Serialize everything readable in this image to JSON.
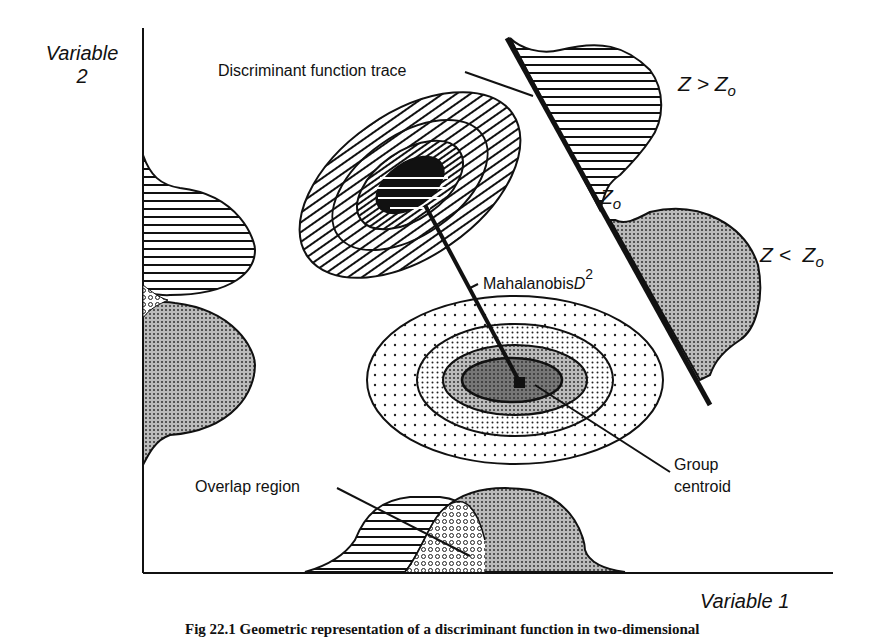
{
  "diagram": {
    "y_axis_label_line1": "Variable",
    "y_axis_label_line2": "2",
    "x_axis_label": "Variable 1",
    "labels": {
      "discriminant_trace": "Discriminant function trace",
      "z_greater": "Z > Z",
      "z_greater_sub": "o",
      "z_less": "Z <  Z",
      "z_less_sub": "o",
      "z_zero": "Z",
      "z_zero_sub": "o",
      "mahalanobis": "Mahalanobis",
      "mahalanobis_d": "D",
      "mahalanobis_sup": "2",
      "group_centroid_line1": "Group",
      "group_centroid_line2": "centroid",
      "overlap_region": "Overlap region"
    },
    "caption": "Fig 22.1 Geometric representation of a discriminant function in two-dimensional"
  }
}
